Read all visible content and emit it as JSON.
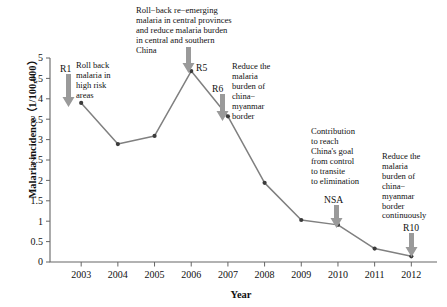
{
  "chart_data": {
    "type": "line",
    "title": "",
    "xlabel": "Year",
    "ylabel": "Malaria incidence（1/100,000）",
    "categories": [
      "2003",
      "2004",
      "2005",
      "2006",
      "2007",
      "2008",
      "2009",
      "2010",
      "2011",
      "2012"
    ],
    "x": [
      2003,
      2004,
      2005,
      2006,
      2007,
      2008,
      2009,
      2010,
      2011,
      2012
    ],
    "values": [
      3.9,
      2.89,
      3.09,
      4.68,
      3.57,
      1.94,
      1.03,
      0.91,
      0.33,
      0.14
    ],
    "series": [
      {
        "name": "Malaria incidence",
        "values": [
          3.9,
          2.89,
          3.09,
          4.68,
          3.57,
          1.94,
          1.03,
          0.91,
          0.33,
          0.14
        ]
      }
    ],
    "ylim": [
      0,
      5
    ],
    "xlim": [
      2002.5,
      2012.5
    ],
    "ytick_labels": [
      "0",
      "0.5",
      "1",
      "1.5",
      "2",
      "2.5",
      "3",
      "3.5",
      "4",
      "4.5",
      "5"
    ],
    "ytick_values": [
      0,
      0.5,
      1,
      1.5,
      2,
      2.5,
      3,
      3.5,
      4,
      4.5,
      5
    ],
    "grid": false,
    "legend": "none",
    "line_color": "#808080",
    "marker_color": "#3b3b3b",
    "axis_color": "#666666",
    "arrow_color": "#9a9a9a",
    "annotations": [
      {
        "tag": "R1",
        "text": "Roll back\nmalaria in\nhigh risk\nareas",
        "target_year": 2003,
        "target_value": 3.9
      },
      {
        "tag": "R5",
        "text": "Roll−back re−emerging\nmalaria in central provinces\nand reduce malaria burden\nin central and southern\nChina",
        "target_year": 2006,
        "target_value": 4.68
      },
      {
        "tag": "R6",
        "text": "Reduce the\nmalaria\nburden of\nchina−\nmyanmar\nborder",
        "target_year": 2007,
        "target_value": 3.57
      },
      {
        "tag": "NSA",
        "text": "Contribution\nto reach\nChina's goal\nfrom control\nto transite\nto elimination",
        "target_year": 2010,
        "target_value": 0.91
      },
      {
        "tag": "R10",
        "text": "Reduce the\nmalaria\nburden of\nchina−\nmyanmar\nborder\ncontinuously",
        "target_year": 2012,
        "target_value": 0.14
      }
    ]
  }
}
